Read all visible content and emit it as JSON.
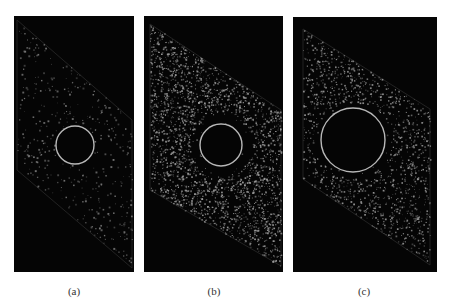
{
  "figure": {
    "panels": [
      {
        "id": "a",
        "caption": "(a)",
        "box": {
          "x": 14,
          "y": 16,
          "w": 120,
          "h": 256
        },
        "band": [
          [
            3,
            4
          ],
          [
            118,
            104
          ],
          [
            118,
            252
          ],
          [
            3,
            154
          ]
        ],
        "ring": {
          "cx": 61,
          "cy": 129,
          "r": 19
        },
        "ring_clear": 0,
        "density": 420,
        "dot_size": 1.1,
        "dot_color": "#7a7a7a",
        "caption_pos": {
          "x": 54,
          "y": 285
        }
      },
      {
        "id": "b",
        "caption": "(b)",
        "box": {
          "x": 144,
          "y": 16,
          "w": 139,
          "h": 256
        },
        "band": [
          [
            6,
            8
          ],
          [
            137,
            94
          ],
          [
            137,
            250
          ],
          [
            6,
            174
          ]
        ],
        "ring": {
          "cx": 77,
          "cy": 129,
          "r": 21
        },
        "ring_clear": 31,
        "density": 2600,
        "dot_size": 1.0,
        "dot_color": "#9a9a9a",
        "caption_pos": {
          "x": 194,
          "y": 285
        }
      },
      {
        "id": "c",
        "caption": "(c)",
        "box": {
          "x": 293,
          "y": 17,
          "w": 144,
          "h": 255
        },
        "band": [
          [
            10,
            12
          ],
          [
            137,
            92
          ],
          [
            137,
            248
          ],
          [
            10,
            162
          ]
        ],
        "ring": {
          "cx": 60,
          "cy": 123,
          "r": 32
        },
        "ring_clear": 38,
        "density": 1300,
        "dot_size": 1.0,
        "dot_color": "#9a9a9a",
        "caption_pos": {
          "x": 344,
          "y": 285
        }
      }
    ],
    "ring_color": "#b8b8b8",
    "background": "#050505"
  }
}
